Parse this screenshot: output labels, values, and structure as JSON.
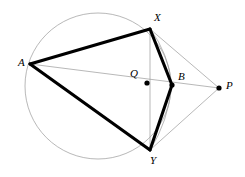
{
  "figure": {
    "canvas": {
      "width": 245,
      "height": 177
    },
    "background_color": "#ffffff",
    "stroke_color": "#000000",
    "thin_stroke_color": "#9a9a9a",
    "circle_stroke_color": "#9a9a9a",
    "thick_width": 3.1,
    "thin_width": 0.7,
    "dot_radius": 2.6
  },
  "circle": {
    "label": "circumcircle",
    "cx": 98,
    "cy": 86,
    "r": 73
  },
  "points": [
    {
      "id": "A",
      "label": "A",
      "x": 30,
      "y": 64,
      "label_x": 18,
      "label_y": 57,
      "dot": false
    },
    {
      "id": "X",
      "label": "X",
      "x": 150,
      "y": 29,
      "label_x": 154,
      "label_y": 12,
      "dot": false
    },
    {
      "id": "Q",
      "label": "Q",
      "x": 147,
      "y": 83,
      "label_x": 130,
      "label_y": 68,
      "dot": true
    },
    {
      "id": "B",
      "label": "B",
      "x": 172,
      "y": 85,
      "label_x": 178,
      "label_y": 71,
      "dot": true
    },
    {
      "id": "P",
      "label": "P",
      "x": 219,
      "y": 88,
      "label_x": 226,
      "label_y": 80,
      "dot": true
    },
    {
      "id": "Y",
      "label": "Y",
      "x": 150,
      "y": 150,
      "label_x": 150,
      "label_y": 155,
      "dot": false
    }
  ],
  "thick_segments": [
    {
      "name": "segment-AX",
      "x1": 30,
      "y1": 64,
      "x2": 150,
      "y2": 29
    },
    {
      "name": "segment-XB",
      "x1": 150,
      "y1": 29,
      "x2": 172,
      "y2": 85
    },
    {
      "name": "segment-BY",
      "x1": 172,
      "y1": 85,
      "x2": 150,
      "y2": 150
    },
    {
      "name": "segment-YA",
      "x1": 150,
      "y1": 150,
      "x2": 30,
      "y2": 64
    }
  ],
  "thin_segments": [
    {
      "name": "segment-XY-chord",
      "x1": 150,
      "y1": 29,
      "x2": 150,
      "y2": 150
    },
    {
      "name": "segment-AP-through-Q-B",
      "x1": 30,
      "y1": 64,
      "x2": 219,
      "y2": 88
    },
    {
      "name": "segment-XP",
      "x1": 150,
      "y1": 29,
      "x2": 219,
      "y2": 88
    },
    {
      "name": "segment-YP",
      "x1": 150,
      "y1": 150,
      "x2": 219,
      "y2": 88
    }
  ],
  "thin_arcs": [
    {
      "name": "arc-XB-minor",
      "d": "M 150 29 Q 168 52 172 85"
    },
    {
      "name": "arc-BY-minor",
      "d": "M 172 85 Q 168 122 150 150"
    }
  ],
  "labels_note": "Point labels are italic serif letters placed beside each vertex."
}
